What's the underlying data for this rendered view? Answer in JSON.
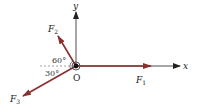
{
  "diagram": {
    "axes": {
      "x_label": "x",
      "y_label": "y",
      "origin_label": "O"
    },
    "forces": [
      {
        "name": "F1",
        "label_main": "F",
        "label_sub": "1",
        "direction_deg": 0
      },
      {
        "name": "F2",
        "label_main": "F",
        "label_sub": "2",
        "angle_label": "60°",
        "direction_deg": 120
      },
      {
        "name": "F3",
        "label_main": "F",
        "label_sub": "3",
        "angle_label": "30°",
        "direction_deg": 210
      }
    ],
    "colors": {
      "force": "#8b2e2e",
      "axis": "#222222",
      "dashed": "#888888"
    }
  }
}
